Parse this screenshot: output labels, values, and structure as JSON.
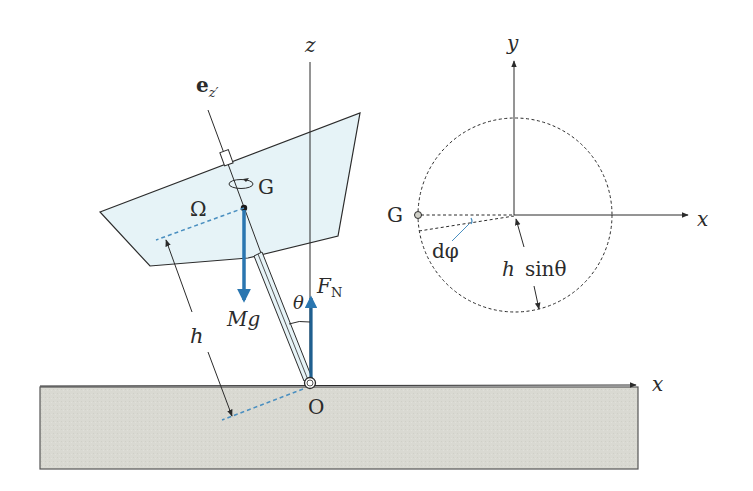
{
  "diagram": {
    "type": "physics-free-body-diagram",
    "left_figure": {
      "labels": {
        "ez_prime": "e",
        "ez_prime_sub": "z′",
        "z_axis": "z",
        "omega": "Ω",
        "G": "G",
        "Mg": "Mg",
        "theta": "θ",
        "FN": "F",
        "FN_sub": "N",
        "h": "h",
        "O": "O",
        "x_axis": "x"
      }
    },
    "right_figure": {
      "labels": {
        "y_axis": "y",
        "x_axis": "x",
        "G": "G",
        "dphi": "dφ",
        "h_sin_theta_h": "h",
        "h_sin_theta_sin": "sinθ"
      }
    },
    "colors": {
      "line": "#2b2b2b",
      "force_arrow": "#2a76b0",
      "blade_fill": "#e6f3f7",
      "ground_fill": "#d9d9d2",
      "dashed_blue": "#4a8fc0"
    }
  }
}
